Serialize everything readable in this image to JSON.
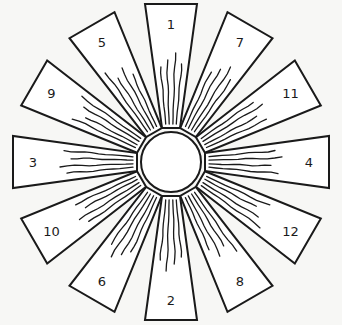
{
  "diagram": {
    "hub": {
      "cx": 171,
      "cy": 162,
      "r": 30
    },
    "blade_geometry": {
      "inner_r": 34,
      "outer_r": 158,
      "inner_half_width": 9,
      "outer_half_width": 26,
      "label_r": 138
    },
    "colors": {
      "stroke": "#1a1a1a",
      "fill": "#ffffff",
      "background": "#f7f7f5"
    },
    "blades": [
      {
        "label": "1",
        "angle_deg": 0
      },
      {
        "label": "7",
        "angle_deg": 30
      },
      {
        "label": "11",
        "angle_deg": 60
      },
      {
        "label": "4",
        "angle_deg": 90
      },
      {
        "label": "12",
        "angle_deg": 120
      },
      {
        "label": "8",
        "angle_deg": 150
      },
      {
        "label": "2",
        "angle_deg": 180
      },
      {
        "label": "6",
        "angle_deg": 210
      },
      {
        "label": "10",
        "angle_deg": 240
      },
      {
        "label": "3",
        "angle_deg": 270
      },
      {
        "label": "9",
        "angle_deg": 300
      },
      {
        "label": "5",
        "angle_deg": 330
      }
    ]
  }
}
